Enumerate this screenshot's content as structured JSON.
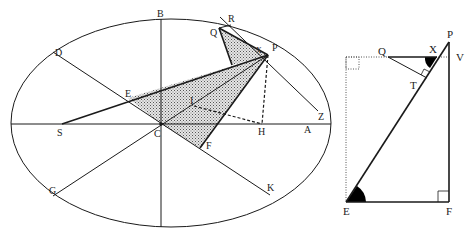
{
  "figures": {
    "ellipse_figure": {
      "description": "Ellipse with center C, focus S, shaded triangles, tangent at P",
      "labels": {
        "B": "B",
        "D": "D",
        "R": "R",
        "Q": "Q",
        "X": "X",
        "P": "P",
        "I": "I",
        "Z": "Z",
        "E": "E",
        "S": "S",
        "C": "C",
        "H": "H",
        "A": "A",
        "F": "F",
        "G": "G",
        "K": "K"
      },
      "colors": {
        "stroke": "#1a1a1a",
        "shade": "#bdbdbd"
      }
    },
    "triangle_figure": {
      "description": "Right triangle EFP with auxiliary segment QX and perpendicular QT",
      "labels": {
        "P": "P",
        "V": "V",
        "Q": "Q",
        "X": "X",
        "T": "T",
        "E": "E",
        "F": "F"
      },
      "colors": {
        "stroke": "#1a1a1a",
        "angle_fill": "#000000"
      }
    }
  }
}
